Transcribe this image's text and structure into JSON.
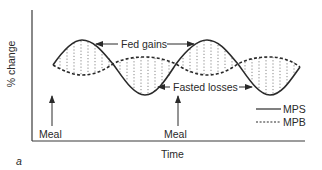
{
  "figure": {
    "panel_label": "a",
    "x_axis_label": "Time",
    "y_axis_label": "% change",
    "annotations": {
      "fed_gains": "Fed gains",
      "fasted_losses": "Fasted losses",
      "meal_1": "Meal",
      "meal_2": "Meal"
    },
    "legend": [
      {
        "label": "MPS",
        "style": "solid"
      },
      {
        "label": "MPB",
        "style": "dashed"
      }
    ],
    "colors": {
      "line": "#2a2a2a",
      "background": "#ffffff"
    }
  }
}
